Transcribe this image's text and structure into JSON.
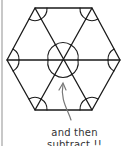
{
  "diagram": {
    "shape": "hexagon",
    "triangles": 6,
    "angle_marks": "arcs at every vertex and six angles around the center",
    "annotation": {
      "line1": "and then",
      "line2": "subtract !!"
    },
    "colors": {
      "stroke": "#1a1a1a",
      "arrow": "#777777",
      "text": "#333333",
      "rule": "#c8c8c8"
    }
  }
}
